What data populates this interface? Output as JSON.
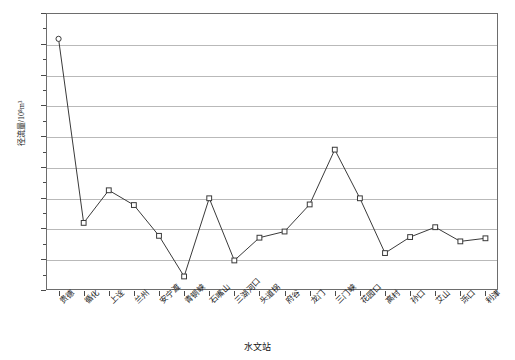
{
  "chart_data": {
    "type": "line",
    "title": "",
    "xlabel": "水文站",
    "ylabel": "径流量/10⁸m³",
    "ylim": [
      -100,
      350
    ],
    "ytick_step": 50,
    "grid": true,
    "legend": "none",
    "marker": "open-square",
    "line_color": "#3a3a3a",
    "grid_color": "#b9b9b9",
    "frame_color": "#6d6d6d",
    "categories": [
      "贵德",
      "循化",
      "上诠",
      "兰州",
      "安宁渡",
      "青铜峡",
      "石嘴山",
      "三湖河口",
      "头道拐",
      "府谷",
      "龙门",
      "三门峡",
      "花园口",
      "高村",
      "孙口",
      "艾山",
      "泺口",
      "利津"
    ],
    "values": [
      308,
      9,
      62,
      38,
      -12,
      -78,
      49,
      -52,
      -15,
      -5,
      39,
      128,
      49,
      -40,
      -14,
      2,
      -21,
      -16
    ],
    "yticks": [
      "350",
      "300",
      "250",
      "200",
      "150",
      "100",
      "50",
      "0",
      "-50",
      "-100"
    ],
    "ytick_values": [
      350,
      300,
      250,
      200,
      150,
      100,
      50,
      0,
      -50,
      -100
    ]
  }
}
